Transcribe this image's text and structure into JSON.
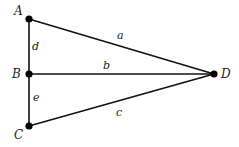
{
  "diagram": {
    "type": "graph",
    "vertices": [
      {
        "id": "A",
        "label": "A",
        "x": 29,
        "y": 19,
        "lx": 19,
        "ly": 14
      },
      {
        "id": "B",
        "label": "B",
        "x": 29,
        "y": 74,
        "lx": 12,
        "ly": 78
      },
      {
        "id": "C",
        "label": "C",
        "x": 29,
        "y": 126,
        "lx": 14,
        "ly": 139
      },
      {
        "id": "D",
        "label": "D",
        "x": 214,
        "y": 74,
        "lx": 222,
        "ly": 78
      }
    ],
    "edges": [
      {
        "id": "a",
        "label": "a",
        "from": "A",
        "to": "D"
      },
      {
        "id": "b",
        "label": "b",
        "from": "B",
        "to": "D"
      },
      {
        "id": "c",
        "label": "c",
        "from": "C",
        "to": "D"
      },
      {
        "id": "d",
        "label": "d",
        "from": "A",
        "to": "B"
      },
      {
        "id": "e",
        "label": "e",
        "from": "B",
        "to": "C"
      }
    ],
    "colors": {
      "line": "#111111",
      "node": "#000000",
      "background": "#ffffff"
    }
  }
}
